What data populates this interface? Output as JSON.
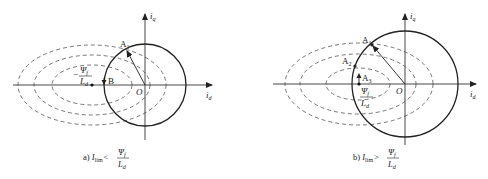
{
  "panels": [
    {
      "id": "a",
      "caption_prefix": "a) ",
      "caption_var": "I",
      "caption_var_sub": "lim",
      "caption_relation": "<",
      "frac_num": "Ψ",
      "frac_num_sub": "f",
      "frac_den": "L",
      "frac_den_sub": "d",
      "axis_x": "i",
      "axis_x_sub": "d",
      "axis_y": "i",
      "axis_y_sub": "q",
      "origin": "O",
      "points": [
        {
          "label": "A",
          "sub": "1"
        },
        {
          "label": "B",
          "sub": ""
        }
      ],
      "center_label_neg": "−",
      "center_num": "Ψ",
      "center_num_sub": "f",
      "center_den": "L",
      "center_den_sub": "d"
    },
    {
      "id": "b",
      "caption_prefix": "b) ",
      "caption_var": "I",
      "caption_var_sub": "lim",
      "caption_relation": ">",
      "frac_num": "Ψ",
      "frac_num_sub": "f",
      "frac_den": "L",
      "frac_den_sub": "d",
      "axis_x": "i",
      "axis_x_sub": "d",
      "axis_y": "i",
      "axis_y_sub": "q",
      "origin": "O",
      "points": [
        {
          "label": "A",
          "sub": "1"
        },
        {
          "label": "A",
          "sub": "2"
        },
        {
          "label": "A",
          "sub": "3"
        }
      ],
      "center_label_neg": "",
      "center_num": "Ψ",
      "center_num_sub": "f",
      "center_den": "L",
      "center_den_sub": "d"
    }
  ]
}
